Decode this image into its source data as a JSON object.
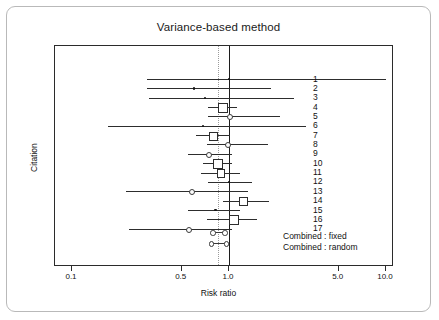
{
  "figure": {
    "title": "Variance-based method",
    "xlabel": "Risk ratio",
    "ylabel": "Citation"
  },
  "axis": {
    "ticks": [
      "0.1",
      "0.5",
      "1.0",
      "5.0",
      "10.0"
    ],
    "tick_values": [
      0.1,
      0.5,
      1.0,
      5.0,
      10.0
    ],
    "scale": "log",
    "xlim": [
      0.08,
      12.0
    ]
  },
  "reference_lines": {
    "null_value": "1.0",
    "pooled_value": "0.85"
  },
  "legend": {
    "fixed": "Combined : fixed",
    "random": "Combined : random"
  },
  "study_labels": [
    "1",
    "2",
    "3",
    "4",
    "5",
    "6",
    "7",
    "8",
    "9",
    "10",
    "11",
    "12",
    "13",
    "14",
    "15",
    "16",
    "17"
  ],
  "chart_data": {
    "type": "scatter",
    "subtype": "forest-plot",
    "title": "Variance-based method",
    "xlabel": "Risk ratio",
    "ylabel": "Citation",
    "xscale": "log",
    "xlim": [
      0.08,
      12.0
    ],
    "xticks": [
      0.1,
      0.5,
      1.0,
      5.0,
      10.0
    ],
    "xticklabels": [
      "0.1",
      "0.5",
      "1.0",
      "5.0",
      "10.0"
    ],
    "grid": false,
    "legend_position": "bottom-right",
    "reference_line_solid": 1.0,
    "reference_line_dotted": 0.85,
    "categories": [
      "1",
      "2",
      "3",
      "4",
      "5",
      "6",
      "7",
      "8",
      "9",
      "10",
      "11",
      "12",
      "13",
      "14",
      "15",
      "16",
      "17"
    ],
    "series": [
      {
        "name": "Individual studies",
        "marker": "square/circle/dot sized by weight",
        "points": [
          {
            "citation": "1",
            "rr": 1.0,
            "ci_low": 0.3,
            "ci_high": 10.0,
            "marker": "dot",
            "weight": 1
          },
          {
            "citation": "2",
            "rr": 0.6,
            "ci_low": 0.3,
            "ci_high": 1.85,
            "marker": "dot",
            "weight": 2
          },
          {
            "citation": "3",
            "rr": 0.7,
            "ci_low": 0.31,
            "ci_high": 2.6,
            "marker": "dot",
            "weight": 1
          },
          {
            "citation": "4",
            "rr": 0.9,
            "ci_low": 0.73,
            "ci_high": 1.12,
            "marker": "square",
            "weight": 6
          },
          {
            "citation": "5",
            "rr": 1.0,
            "ci_low": 0.73,
            "ci_high": 2.1,
            "marker": "circle",
            "weight": 3
          },
          {
            "citation": "6",
            "rr": 0.68,
            "ci_low": 0.17,
            "ci_high": 3.1,
            "marker": "dot",
            "weight": 1
          },
          {
            "citation": "7",
            "rr": 0.78,
            "ci_low": 0.62,
            "ci_high": 1.02,
            "marker": "square",
            "weight": 5
          },
          {
            "citation": "8",
            "rr": 0.97,
            "ci_low": 0.72,
            "ci_high": 1.78,
            "marker": "circle",
            "weight": 3
          },
          {
            "citation": "9",
            "rr": 0.73,
            "ci_low": 0.55,
            "ci_high": 1.05,
            "marker": "circle",
            "weight": 3
          },
          {
            "citation": "10",
            "rr": 0.84,
            "ci_low": 0.68,
            "ci_high": 1.05,
            "marker": "square",
            "weight": 7
          },
          {
            "citation": "11",
            "rr": 0.88,
            "ci_low": 0.66,
            "ci_high": 1.18,
            "marker": "square",
            "weight": 4
          },
          {
            "citation": "12",
            "rr": 1.0,
            "ci_low": 0.73,
            "ci_high": 1.4,
            "marker": "dot",
            "weight": 3
          },
          {
            "citation": "13",
            "rr": 0.57,
            "ci_low": 0.22,
            "ci_high": 1.32,
            "marker": "circle",
            "weight": 3
          },
          {
            "citation": "14",
            "rr": 1.22,
            "ci_low": 0.92,
            "ci_high": 1.8,
            "marker": "square",
            "weight": 5
          },
          {
            "citation": "15",
            "rr": 0.82,
            "ci_low": 0.55,
            "ci_high": 1.18,
            "marker": "dot",
            "weight": 3
          },
          {
            "citation": "16",
            "rr": 1.06,
            "ci_low": 0.72,
            "ci_high": 1.5,
            "marker": "square",
            "weight": 6
          },
          {
            "citation": "17",
            "rr": 0.55,
            "ci_low": 0.23,
            "ci_high": 1.05,
            "marker": "circle",
            "weight": 3
          }
        ]
      },
      {
        "name": "Combined : fixed",
        "points": [
          {
            "rr": 0.85,
            "ci_low": 0.78,
            "ci_high": 0.93,
            "marker": "open-circle-ends"
          }
        ]
      },
      {
        "name": "Combined : random",
        "points": [
          {
            "rr": 0.85,
            "ci_low": 0.76,
            "ci_high": 0.95,
            "marker": "open-circle-ends"
          }
        ]
      }
    ]
  }
}
